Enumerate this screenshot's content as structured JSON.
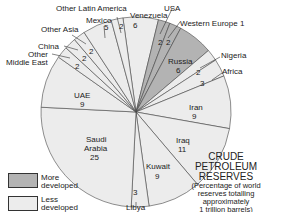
{
  "chart_data": {
    "type": "pie",
    "title": "CRUDE PETROLEUM RESERVES",
    "subtitle": "(Percentage of world reserves totalling approximately 1 trillion barrels)",
    "unit": "percent",
    "slices": [
      {
        "label": "Venezuela",
        "value": 6,
        "group": "Less developed"
      },
      {
        "label": "USA",
        "value": 2,
        "group": "More developed"
      },
      {
        "label": "Western Europe 1",
        "value": 2,
        "group": "More developed"
      },
      {
        "label": "Russia",
        "value": 6,
        "group": "More developed"
      },
      {
        "label": "Nigeria",
        "value": 2,
        "group": "Less developed"
      },
      {
        "label": "Africa",
        "value": 3,
        "group": "Less developed"
      },
      {
        "label": "Iran",
        "value": 9,
        "group": "Less developed"
      },
      {
        "label": "Iraq",
        "value": 11,
        "group": "Less developed"
      },
      {
        "label": "Kuwait",
        "value": 9,
        "group": "Less developed"
      },
      {
        "label": "Libya",
        "value": 3,
        "group": "Less developed"
      },
      {
        "label": "Saudi Arabia",
        "value": 25,
        "group": "Less developed"
      },
      {
        "label": "UAE",
        "value": 9,
        "group": "Less developed"
      },
      {
        "label": "Other Middle East",
        "value": 2,
        "group": "Less developed"
      },
      {
        "label": "China",
        "value": 2,
        "group": "Less developed"
      },
      {
        "label": "Other Asia",
        "value": 2,
        "group": "Less developed"
      },
      {
        "label": "Mexico",
        "value": 5,
        "group": "Less developed"
      },
      {
        "label": "Other Latin America",
        "value": 2,
        "group": "Less developed"
      }
    ],
    "legend": [
      {
        "label": "More developed",
        "color": "#b3b3b3"
      },
      {
        "label": "Less developed",
        "color": "#ececec"
      }
    ],
    "legend_position": "bottom-left"
  },
  "labels": {
    "venezuela": "Venezuela",
    "usa": "USA",
    "western_europe": "Western Europe 1",
    "russia": "Russia",
    "nigeria": "Nigeria",
    "africa": "Africa",
    "iran": "Iran",
    "iraq": "Iraq",
    "kuwait": "Kuwait",
    "libya": "Libya",
    "saudi_1": "Saudi",
    "saudi_2": "Arabia",
    "uae": "UAE",
    "other_me_1": "Other",
    "other_me_2": "Middle East",
    "china": "China",
    "other_asia": "Other Asia",
    "mexico": "Mexico",
    "other_latam": "Other Latin America"
  },
  "values": {
    "venezuela": "6",
    "usa": "2",
    "western_europe": "2",
    "russia": "6",
    "nigeria": "2",
    "africa": "3",
    "iran": "9",
    "iraq": "11",
    "kuwait": "9",
    "libya": "3",
    "saudi": "25",
    "uae": "9",
    "other_me": "2",
    "china": "2",
    "other_asia": "2",
    "mexico": "5",
    "other_latam": "2"
  },
  "title": {
    "line1": "CRUDE",
    "line2": "PETROLEUM",
    "line3": "RESERVES"
  },
  "subtitle": {
    "line1": "(Percentage of world",
    "line2": "reserves totalling",
    "line3": "approximately",
    "line4": "1 trillion barrels)"
  },
  "legend": {
    "more_1": "More",
    "more_2": "developed",
    "less_1": "Less",
    "less_2": "developed"
  },
  "colors": {
    "more": "#b3b3b3",
    "less": "#ececec",
    "outline": "#444444"
  }
}
